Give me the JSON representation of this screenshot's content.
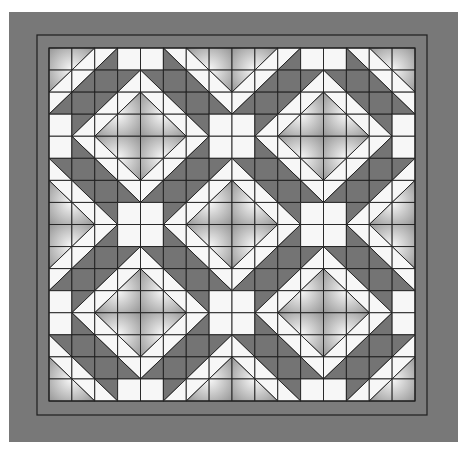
{
  "colors": {
    "background": "#ffffff",
    "border": "#787878",
    "inner_band": "#7c7c7c",
    "line": "#1e1e1e",
    "white": "#f7f7f7",
    "dark": "#747474",
    "gradient_light": "#fafafa",
    "gradient_dark": "#7e7e7e"
  },
  "layout": {
    "outer": {
      "x": 9,
      "y": 12,
      "w": 449,
      "h": 430
    },
    "inner_line": {
      "x": 37,
      "y": 35,
      "w": 390,
      "h": 380
    },
    "quilt": {
      "x": 49,
      "y": 48,
      "w": 366,
      "h": 353
    },
    "grid": {
      "cols": 16,
      "rows": 16
    }
  },
  "tile": {
    "size": 8,
    "legend": {
      "W": "white square",
      "D": "dark square",
      "G": "gradient square",
      "A/B:s": "slash diagonal, A = top-left half, B = bottom-right half",
      "A/B:b": "backslash diagonal, A = top-right half, B = bottom-left half"
    },
    "rows_top_half": [
      [
        "G",
        "G/W:s",
        "W/D:s",
        "W",
        "W",
        "W/D:b",
        "G/W:b",
        "G"
      ],
      [
        "G/W:s",
        "W/D:s",
        "D",
        "D/W:s",
        "D/W:b",
        "D",
        "W/D:b",
        "G/W:b"
      ],
      [
        "W/D:s",
        "D",
        "D/W:s",
        "W/G:s",
        "W/G:b",
        "D/W:b",
        "D",
        "W/D:b"
      ],
      [
        "W",
        "D/W:s",
        "W/G:s",
        "G",
        "G",
        "W/G:b",
        "D/W:b",
        "W"
      ]
    ]
  }
}
